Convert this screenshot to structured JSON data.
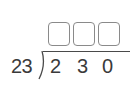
{
  "problem": {
    "type": "long-division",
    "divisor": "23",
    "dividend_digits": [
      "2",
      "3",
      "0"
    ],
    "quotient_boxes": [
      {
        "value": ""
      },
      {
        "value": ""
      },
      {
        "value": ""
      }
    ]
  }
}
